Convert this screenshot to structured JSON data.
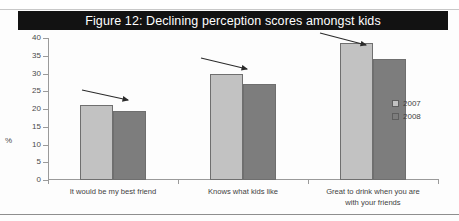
{
  "figure": {
    "title": "Figure 12: Declining perception scores amongst kids",
    "axis_unit": "%"
  },
  "legend": {
    "position": "right",
    "items": [
      {
        "label": "2007",
        "color": "#c2c2c2"
      },
      {
        "label": "2008",
        "color": "#7d7d7d"
      }
    ]
  },
  "annotations": [
    {
      "name": "declining-arrow-1",
      "note": "down-right arrow over group 1"
    },
    {
      "name": "declining-arrow-2",
      "note": "down-right arrow over group 2"
    },
    {
      "name": "declining-arrow-3",
      "note": "down-right arrow over group 3"
    }
  ],
  "axis": {
    "yticks": [
      "40",
      "35",
      "30",
      "25",
      "20",
      "15",
      "10",
      "5",
      "0"
    ],
    "categories": [
      {
        "line1": "It would be my best friend",
        "line2": ""
      },
      {
        "line1": "Knows what kids like",
        "line2": ""
      },
      {
        "line1": "Great to drink when you are",
        "line2": "with your friends"
      }
    ]
  },
  "chart_data": {
    "type": "bar",
    "title": "Figure 12: Declining perception scores amongst kids",
    "xlabel": "",
    "ylabel": "%",
    "ylim": [
      0,
      40
    ],
    "ytick_step": 5,
    "grid": false,
    "legend_position": "right",
    "categories": [
      "It would be my best friend",
      "Knows what kids like",
      "Great to drink when you are with your friends"
    ],
    "series": [
      {
        "name": "2007",
        "color": "#c2c2c2",
        "values": [
          21,
          30,
          38.5
        ]
      },
      {
        "name": "2008",
        "color": "#7d7d7d",
        "values": [
          19.5,
          27,
          34
        ]
      }
    ],
    "annotations": [
      "declining arrow over category 1",
      "declining arrow over category 2",
      "declining arrow over category 3"
    ]
  }
}
